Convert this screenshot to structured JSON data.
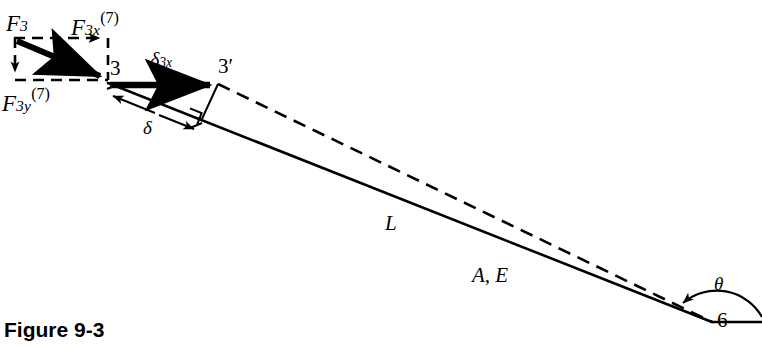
{
  "figure": {
    "caption": "Figure 9-3",
    "caption_x": 4,
    "caption_y": 318,
    "caption_size": 21
  },
  "labels": {
    "force_resultant": {
      "base": "F",
      "sub": "3",
      "sup": "",
      "x": 6,
      "y": 12,
      "size": 23
    },
    "force_x_component": {
      "base": "F",
      "sub": "3x",
      "sup": "(7)",
      "x": 71,
      "y": 16,
      "size": 23
    },
    "force_y_component": {
      "base": "F",
      "sub": "3y",
      "sup": "(7)",
      "x": 2,
      "y": 92,
      "size": 23
    },
    "node_3": {
      "text": "3",
      "x": 110,
      "y": 58,
      "size": 21
    },
    "node_3_prime": {
      "text": "3′",
      "x": 218,
      "y": 56,
      "size": 21
    },
    "node_6": {
      "text": "6",
      "x": 717,
      "y": 310,
      "size": 21
    },
    "delta_3x": {
      "base": "δ",
      "sub": "3x",
      "x": 150,
      "y": 50,
      "size": 20
    },
    "delta": {
      "text": "δ",
      "x": 143,
      "y": 118,
      "size": 19
    },
    "length_L": {
      "text": "L",
      "x": 385,
      "y": 213,
      "size": 21
    },
    "area_modulus": {
      "text": "A, E",
      "x": 472,
      "y": 265,
      "size": 21
    },
    "angle_theta": {
      "text": "θ",
      "x": 714,
      "y": 274,
      "size": 19
    }
  },
  "geometry": {
    "node3": {
      "x": 108,
      "y": 83
    },
    "node3_prime": {
      "x": 218,
      "y": 83
    },
    "node6": {
      "x": 712,
      "y": 322
    },
    "force_box": {
      "x1": 14,
      "y1": 38,
      "x2": 108,
      "y2": 80
    },
    "perp_foot": {
      "x": 201,
      "y": 116
    },
    "dim_start": {
      "x": 113,
      "y": 95
    },
    "dim_end": {
      "x": 196,
      "y": 128
    }
  },
  "style": {
    "ink": "#000000",
    "background": "#ffffff",
    "thin_stroke": 1.9,
    "bold_stroke": 6.5,
    "dash_pattern": "11,7"
  }
}
